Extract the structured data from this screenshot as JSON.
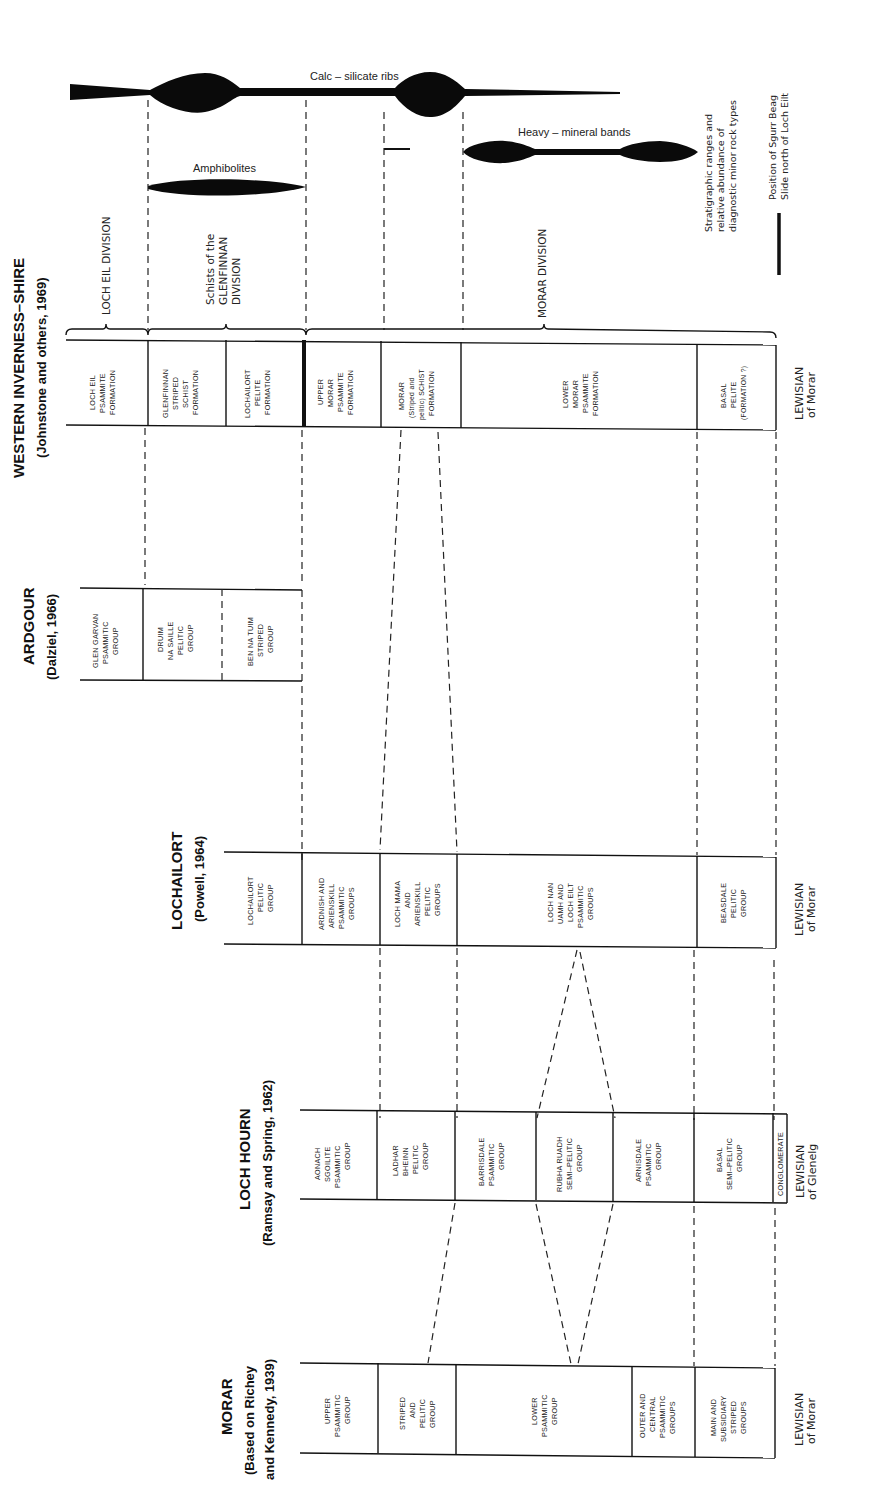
{
  "diagram": {
    "orientation": "rotated 90 degrees counter-clockwise; columns run left to right, strata read from youngest (top of screen) to oldest (bottom of screen)",
    "minor_rock_types": {
      "calc_silicate": "Calc – silicate ribs",
      "amphibolites": "Amphibolites",
      "heavy_mineral": "Heavy – mineral bands"
    },
    "legend": {
      "ranges_line1": "Stratigraphic ranges and",
      "ranges_line2": "relative abundance of",
      "ranges_line3": "diagnostic minor rock types",
      "slide_line1": "Position of Sgurr Beag",
      "slide_line2": "Slide north of Loch Eilt"
    },
    "divisions": {
      "loch_eil": "LOCH EIL DIVISION",
      "glenfinnan_1": "Schists of the",
      "glenfinnan_2": "GLENFINNAN",
      "glenfinnan_3": "DIVISION",
      "morar": "MORAR DIVISION"
    },
    "columns": [
      {
        "title": "WESTERN INVERNESS–SHIRE",
        "source": "(Johnstone and others, 1969)",
        "units": [
          [
            "LOCH EIL",
            "PSAMMITE",
            "FORMATION"
          ],
          [
            "GLENFINNAN",
            "STRIPED",
            "SCHIST",
            "FORMATION"
          ],
          [
            "LOCHAILORT",
            "PELITE",
            "FORMATION"
          ],
          [
            "UPPER",
            "MORAR",
            "PSAMMITE",
            "FORMATION"
          ],
          [
            "MORAR",
            "(Striped and",
            "pelitic) SCHIST",
            "FORMATION"
          ],
          [
            "LOWER",
            "MORAR",
            "PSAMMITE",
            "FORMATION"
          ],
          [
            "BASAL",
            "PELITE",
            "(FORMATION ?)"
          ]
        ],
        "base_1": "LEWISIAN",
        "base_2": "of Morar"
      },
      {
        "title": "ARDGOUR",
        "source": "(Dalziel, 1966)",
        "units": [
          [
            "GLEN GARVAN",
            "PSAMMITIC",
            "GROUP"
          ],
          [
            "DRUIM",
            "NA SAILLE",
            "PELITIC",
            "GROUP"
          ],
          [
            "BEN NA TUIM",
            "STRIPED",
            "GROUP"
          ]
        ]
      },
      {
        "title": "LOCHAILORT",
        "source": "(Powell, 1964)",
        "units": [
          [
            "LOCHAILORT",
            "PELITIC",
            "GROUP"
          ],
          [
            "ARDNISH AND",
            "ARIENSKILL",
            "PSAMMITIC",
            "GROUPS"
          ],
          [
            "LOCH MAMA",
            "AND",
            "ARIENSKILL",
            "PELITIC",
            "GROUPS"
          ],
          [
            "LOCH NAN",
            "UAMH AND",
            "LOCH EILT",
            "PSAMMITIC",
            "GROUPS"
          ],
          [
            "BEASDALE",
            "PELITIC",
            "GROUP"
          ]
        ],
        "base_1": "LEWISIAN",
        "base_2": "of Morar"
      },
      {
        "title": "LOCH HOURN",
        "source": "(Ramsay and Spring, 1962)",
        "units": [
          [
            "AONACH",
            "SGOILITE",
            "PSAMMITIC",
            "GROUP"
          ],
          [
            "LADHAR",
            "BHEINN",
            "PELITIC",
            "GROUP"
          ],
          [
            "BARRISDALE",
            "PSAMMITIC",
            "GROUP"
          ],
          [
            "RUBHA RUADH",
            "SEMI–PELITIC",
            "GROUP"
          ],
          [
            "ARNISDALE",
            "PSAMMITIC",
            "GROUP"
          ],
          [
            "BASAL",
            "SEMI–PELITIC",
            "GROUP"
          ],
          [
            "CONGLOMERATE"
          ]
        ],
        "base_1": "LEWISIAN",
        "base_2": "of Glenelg"
      },
      {
        "title": "MORAR",
        "source_1": "(Based on Richey",
        "source_2": "and Kennedy, 1939)",
        "units": [
          [
            "UPPER",
            "PSAMMITIC",
            "GROUP"
          ],
          [
            "STRIPED",
            "AND",
            "PELITIC",
            "GROUP"
          ],
          [
            "LOWER",
            "PSAMMITIC",
            "GROUP"
          ],
          [
            "OUTER AND",
            "CENTRAL",
            "PSAMMITIC",
            "GROUPS"
          ],
          [
            "MAIN AND",
            "SUBSIDIARY",
            "STRIPED",
            "GROUPS"
          ]
        ],
        "base_1": "LEWISIAN",
        "base_2": "of Morar"
      }
    ]
  }
}
